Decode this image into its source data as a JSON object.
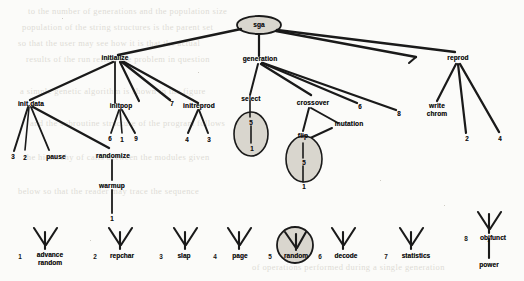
{
  "diagram": {
    "root": {
      "label": "sga"
    },
    "level1": [
      {
        "label": "initialize"
      },
      {
        "label": "generation"
      },
      {
        "label": "reprod"
      }
    ],
    "initialize_children": [
      {
        "label": "init.data"
      },
      {
        "label": "initpop"
      },
      {
        "label": "7"
      },
      {
        "label": "initreprod"
      }
    ],
    "init_data_children": [
      {
        "label": "3"
      },
      {
        "label": "2"
      },
      {
        "label": "pause"
      },
      {
        "label": "randomize"
      }
    ],
    "initpop_children": [
      {
        "label": "6"
      },
      {
        "label": "1"
      },
      {
        "label": "9"
      }
    ],
    "initreprod_children": [
      {
        "label": "4"
      },
      {
        "label": "3"
      }
    ],
    "randomize_children": [
      {
        "label": "warmup"
      }
    ],
    "warmup_children": [
      {
        "label": "1"
      }
    ],
    "generation_children": [
      {
        "label": "select"
      },
      {
        "label": "crossover"
      },
      {
        "label": "6"
      },
      {
        "label": "8"
      }
    ],
    "select_children": [
      {
        "label": "5"
      },
      {
        "label": "1"
      }
    ],
    "crossover_children": [
      {
        "label": "flip"
      },
      {
        "label": "mutation"
      }
    ],
    "flip_children": [
      {
        "label": "5"
      },
      {
        "label": "1"
      }
    ],
    "reprod_children": [
      {
        "label": "write chrom"
      },
      {
        "label": "2"
      },
      {
        "label": "4"
      }
    ],
    "legend": [
      {
        "index": "1",
        "label": "advance random",
        "circled": false
      },
      {
        "index": "2",
        "label": "repchar",
        "circled": false
      },
      {
        "index": "3",
        "label": "slap",
        "circled": false
      },
      {
        "index": "4",
        "label": "page",
        "circled": false
      },
      {
        "index": "5",
        "label": "random",
        "circled": true
      },
      {
        "index": "6",
        "label": "decode",
        "circled": false
      },
      {
        "index": "7",
        "label": "statistics",
        "circled": false
      },
      {
        "index": "8",
        "label": "objfunct",
        "circled": false
      }
    ],
    "legend_extra": [
      {
        "label": "power"
      }
    ],
    "colors": {
      "ink": "#141414",
      "paper": "#fbfbf9",
      "circle_fill": "#d9d6ce",
      "ghost": "#dedcd6"
    },
    "background_ghost_text": [
      "to  the  number  of  generations  and  the  population  size",
      "population  of  the  string  structures  is  the  parent  set",
      "so  that  the  user  may  see  how  it  is  that  the  actual",
      "results  of  the  run  reflect  the  problem  in  question",
      "a  simple  genetic  algorithm  is  shown  in  the  figure",
      "and  the  subroutine  structure  of  the  program  follows",
      "the  hierarchy  of  calls  between  the  modules  given",
      "below  so  that  the  reader  may  trace  the  sequence",
      "of  operations  performed  during  a  single  generation"
    ]
  }
}
